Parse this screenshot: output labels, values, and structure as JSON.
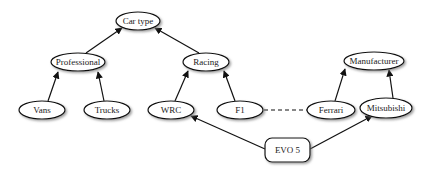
{
  "diagram": {
    "nodes": [
      {
        "id": "car_type",
        "label": "Car type",
        "shape": "ellipse",
        "cx": 138,
        "cy": 21,
        "rx": 22,
        "ry": 9
      },
      {
        "id": "professional",
        "label": "Professional",
        "shape": "ellipse",
        "cx": 78,
        "cy": 62,
        "rx": 27,
        "ry": 9
      },
      {
        "id": "racing",
        "label": "Racing",
        "shape": "ellipse",
        "cx": 206,
        "cy": 62,
        "rx": 23,
        "ry": 9
      },
      {
        "id": "manufacturer",
        "label": "Manufacturer",
        "shape": "ellipse",
        "cx": 374,
        "cy": 61,
        "rx": 30,
        "ry": 9
      },
      {
        "id": "vans",
        "label": "Vans",
        "shape": "ellipse",
        "cx": 42,
        "cy": 110,
        "rx": 23,
        "ry": 9
      },
      {
        "id": "trucks",
        "label": "Trucks",
        "shape": "ellipse",
        "cx": 107,
        "cy": 110,
        "rx": 23,
        "ry": 9
      },
      {
        "id": "wrc",
        "label": "WRC",
        "shape": "ellipse",
        "cx": 171,
        "cy": 110,
        "rx": 23,
        "ry": 9
      },
      {
        "id": "f1",
        "label": "F1",
        "shape": "ellipse",
        "cx": 240,
        "cy": 110,
        "rx": 23,
        "ry": 9
      },
      {
        "id": "ferrari",
        "label": "Ferrari",
        "shape": "ellipse",
        "cx": 331,
        "cy": 110,
        "rx": 24,
        "ry": 9
      },
      {
        "id": "mitsubishi",
        "label": "Mitsubishi",
        "shape": "ellipse",
        "cx": 386,
        "cy": 108,
        "rx": 26,
        "ry": 10
      },
      {
        "id": "evo5",
        "label": "EVO 5",
        "shape": "rounded-rect",
        "x": 265,
        "y": 138,
        "w": 45,
        "h": 24
      }
    ],
    "edges": [
      {
        "from": "professional",
        "to": "car_type",
        "style": "solid",
        "arrow": true
      },
      {
        "from": "racing",
        "to": "car_type",
        "style": "solid",
        "arrow": true
      },
      {
        "from": "vans",
        "to": "professional",
        "style": "solid",
        "arrow": true
      },
      {
        "from": "trucks",
        "to": "professional",
        "style": "solid",
        "arrow": true
      },
      {
        "from": "wrc",
        "to": "racing",
        "style": "solid",
        "arrow": true
      },
      {
        "from": "f1",
        "to": "racing",
        "style": "solid",
        "arrow": true
      },
      {
        "from": "ferrari",
        "to": "manufacturer",
        "style": "solid",
        "arrow": true
      },
      {
        "from": "mitsubishi",
        "to": "manufacturer",
        "style": "solid",
        "arrow": true
      },
      {
        "from": "f1",
        "to": "ferrari",
        "style": "dashed",
        "arrow": false
      },
      {
        "from": "evo5",
        "to": "wrc",
        "style": "solid",
        "arrow": true
      },
      {
        "from": "evo5",
        "to": "mitsubishi",
        "style": "solid",
        "arrow": true
      }
    ]
  }
}
